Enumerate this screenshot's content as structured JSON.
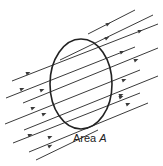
{
  "diagram": {
    "label": {
      "text": "Area ",
      "variable": "A"
    },
    "colors": {
      "line": "#3a3a3a",
      "ellipse": "#222222",
      "text": "#222222",
      "background": "#ffffff"
    },
    "ellipse": {
      "cx": 81,
      "cy": 84,
      "rx": 31,
      "ry": 45
    },
    "field_direction": "up-right",
    "field_lines": [
      {
        "x1": 88,
        "y1": 34,
        "x2": 135,
        "y2": 10,
        "arrows": [
          [
            108,
            24
          ]
        ]
      },
      {
        "x1": 60,
        "y1": 60,
        "x2": 153,
        "y2": 15,
        "arrows": [
          [
            107,
            38
          ]
        ]
      },
      {
        "x1": 12,
        "y1": 81,
        "x2": 158,
        "y2": 24,
        "arrows": [
          [
            28,
            73
          ],
          [
            140,
            31
          ]
        ]
      },
      {
        "x1": 6,
        "y1": 98,
        "x2": 135,
        "y2": 47,
        "arrows": [
          [
            22,
            89
          ],
          [
            122,
            52
          ]
        ]
      },
      {
        "x1": 23,
        "y1": 103,
        "x2": 158,
        "y2": 48,
        "arrows": [
          [
            42,
            90
          ],
          [
            136,
            60
          ]
        ]
      },
      {
        "x1": 5,
        "y1": 124,
        "x2": 140,
        "y2": 70,
        "arrows": [
          [
            33,
            108
          ],
          [
            124,
            80
          ]
        ]
      },
      {
        "x1": 24,
        "y1": 130,
        "x2": 158,
        "y2": 76,
        "arrows": [
          [
            44,
            114
          ],
          [
            121,
            95
          ]
        ]
      },
      {
        "x1": 13,
        "y1": 143,
        "x2": 140,
        "y2": 93,
        "arrows": [
          [
            30,
            135
          ],
          [
            121,
            97
          ]
        ]
      },
      {
        "x1": 29,
        "y1": 152,
        "x2": 148,
        "y2": 103,
        "arrows": [
          [
            50,
            137
          ],
          [
            128,
            104
          ]
        ]
      },
      {
        "x1": 36,
        "y1": 160,
        "x2": 98,
        "y2": 130,
        "arrows": [
          [
            50,
            146
          ]
        ]
      }
    ]
  }
}
